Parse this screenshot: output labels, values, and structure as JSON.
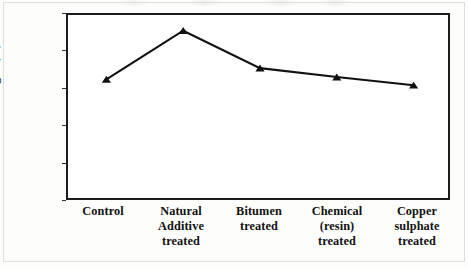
{
  "chart_data": {
    "type": "line",
    "title": "",
    "xlabel": "",
    "ylabel": "Tensile strength (lb)",
    "categories": [
      "Control",
      "Natural\nAdditive\ntreated",
      "Bitumen\ntreated",
      "Chemical\n(resin)\ntreated",
      "Copper\nsulphate\ntreated"
    ],
    "values": [
      164,
      229,
      179,
      167,
      156
    ],
    "ylim": [
      0,
      250
    ],
    "yticks": [
      0,
      50,
      100,
      150,
      200,
      250
    ],
    "ytick_labels": [
      "0",
      "50",
      "100",
      "150",
      "200",
      "250"
    ],
    "grid": false,
    "legend": "none",
    "marker": "triangle",
    "line_color": "#111111",
    "marker_color": "#111111",
    "plot_border_color": "#1c1c1c",
    "background_color": "#ffffff"
  }
}
